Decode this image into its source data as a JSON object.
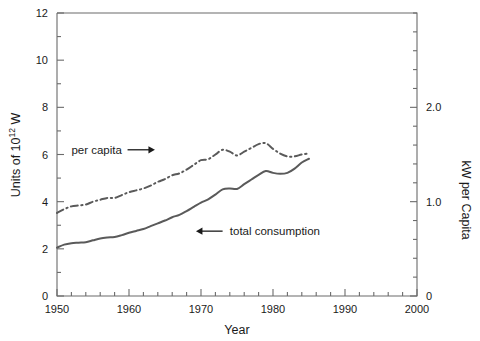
{
  "chart_data": {
    "type": "line",
    "title": "",
    "xlabel": "Year",
    "ylabel": "Units of 10",
    "ylabel_exponent": "12",
    "ylabel_suffix": " W",
    "ylabel_right": "kW per Capita",
    "xlim": [
      1950,
      2000
    ],
    "ylim": [
      0,
      12
    ],
    "ylim_right": [
      0,
      3.0
    ],
    "xticks": [
      1950,
      1960,
      1970,
      1980,
      1990,
      2000
    ],
    "xtick_labels": [
      "1950",
      "1960",
      "1970",
      "1980",
      "1990",
      "2000"
    ],
    "xticks_minor_step": 2,
    "yticks": [
      0,
      2,
      4,
      6,
      8,
      10,
      12
    ],
    "ytick_labels": [
      "0",
      "2",
      "4",
      "6",
      "8",
      "10",
      "12"
    ],
    "yticks_minor_step": 1,
    "yticks_right": [
      0,
      1.0,
      2.0
    ],
    "ytick_labels_right": [
      "0",
      "1.0",
      "2.0"
    ],
    "yticks_right_minor_step": 0.2,
    "grid": false,
    "legend": "annotations",
    "annotations": [
      {
        "id": "per-capita",
        "text": "per capita",
        "arrow": "right",
        "text_x": 1952.0,
        "text_y": 6.2,
        "arrow_from_x": 1959.8,
        "arrow_to_x": 1963.6,
        "arrow_y": 6.2
      },
      {
        "id": "total-consumption",
        "text": "total consumption",
        "arrow": "left",
        "text_x": 1974.0,
        "text_y": 2.75,
        "arrow_from_x": 1973.0,
        "arrow_to_x": 1969.3,
        "arrow_y": 2.75
      }
    ],
    "series": [
      {
        "name": "total consumption",
        "style": "solid",
        "axis": "left",
        "units": "10^12 W",
        "x": [
          1950,
          1951,
          1952,
          1953,
          1954,
          1955,
          1956,
          1957,
          1958,
          1959,
          1960,
          1961,
          1962,
          1963,
          1964,
          1965,
          1966,
          1967,
          1968,
          1969,
          1970,
          1971,
          1972,
          1973,
          1974,
          1975,
          1976,
          1977,
          1978,
          1979,
          1980,
          1981,
          1982,
          1983,
          1984,
          1985
        ],
        "values": [
          2.05,
          2.18,
          2.24,
          2.26,
          2.28,
          2.36,
          2.44,
          2.48,
          2.5,
          2.58,
          2.68,
          2.76,
          2.84,
          2.96,
          3.08,
          3.2,
          3.34,
          3.44,
          3.6,
          3.78,
          3.96,
          4.1,
          4.3,
          4.52,
          4.56,
          4.54,
          4.74,
          4.94,
          5.14,
          5.3,
          5.22,
          5.18,
          5.22,
          5.4,
          5.66,
          5.82
        ]
      },
      {
        "name": "per capita",
        "style": "dash-dot",
        "axis": "right",
        "units": "kW per capita",
        "x": [
          1950,
          1951,
          1952,
          1953,
          1954,
          1955,
          1956,
          1957,
          1958,
          1959,
          1960,
          1961,
          1962,
          1963,
          1964,
          1965,
          1966,
          1967,
          1968,
          1969,
          1970,
          1971,
          1972,
          1973,
          1974,
          1975,
          1976,
          1977,
          1978,
          1979,
          1980,
          1981,
          1982,
          1983,
          1984,
          1985
        ],
        "values": [
          0.88,
          0.92,
          0.95,
          0.96,
          0.97,
          1.0,
          1.02,
          1.04,
          1.04,
          1.07,
          1.1,
          1.12,
          1.14,
          1.17,
          1.21,
          1.24,
          1.28,
          1.3,
          1.34,
          1.39,
          1.44,
          1.45,
          1.5,
          1.55,
          1.53,
          1.49,
          1.53,
          1.57,
          1.61,
          1.62,
          1.56,
          1.51,
          1.48,
          1.48,
          1.5,
          1.51
        ]
      }
    ],
    "colors": {
      "line": "#5a5a5a",
      "axis": "#6b6b6b",
      "text": "#1a1a1a",
      "background": "#ffffff"
    }
  }
}
